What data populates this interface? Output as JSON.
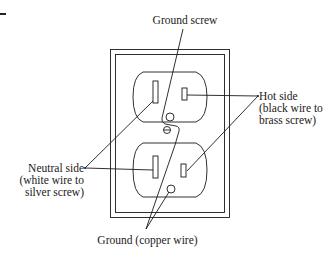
{
  "diagram": {
    "stroke_color": "#1a1a1a",
    "labels": {
      "ground_screw": {
        "text": "Ground screw"
      },
      "hot_side": {
        "lines": [
          "Hot side",
          "(black wire to",
          "brass screw)"
        ]
      },
      "neutral_side": {
        "lines": [
          "Neutral side",
          "(white wire to",
          "silver screw)"
        ]
      },
      "ground_wire": {
        "text": "Ground (copper wire)"
      }
    },
    "components": [
      "wall-plate",
      "upper-outlet",
      "lower-outlet",
      "neutral-slot-upper",
      "hot-slot-upper",
      "neutral-slot-lower",
      "hot-slot-lower",
      "ground-screw",
      "ground-hole-lower"
    ]
  }
}
